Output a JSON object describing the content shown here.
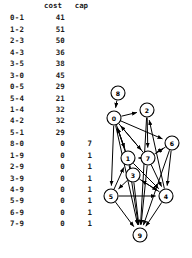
{
  "figure": {
    "kind": "edge-cost-capacity-table-with-directed-graph",
    "background_color": "#ffffff",
    "ink_color": "#000000"
  },
  "table": {
    "name": "edge-cost-cap-table",
    "columns": [
      "",
      "cost",
      "cap"
    ],
    "headers": {
      "pair": "",
      "cost": "cost",
      "cap": "cap"
    },
    "rows": [
      {
        "pair": "0-1",
        "cost": "41",
        "cap": ""
      },
      {
        "pair": "1-2",
        "cost": "51",
        "cap": ""
      },
      {
        "pair": "2-3",
        "cost": "50",
        "cap": ""
      },
      {
        "pair": "4-3",
        "cost": "36",
        "cap": ""
      },
      {
        "pair": "3-5",
        "cost": "38",
        "cap": ""
      },
      {
        "pair": "3-0",
        "cost": "45",
        "cap": ""
      },
      {
        "pair": "0-5",
        "cost": "29",
        "cap": ""
      },
      {
        "pair": "5-4",
        "cost": "21",
        "cap": ""
      },
      {
        "pair": "1-4",
        "cost": "32",
        "cap": ""
      },
      {
        "pair": "4-2",
        "cost": "32",
        "cap": ""
      },
      {
        "pair": "5-1",
        "cost": "29",
        "cap": ""
      },
      {
        "pair": "8-0",
        "cost": "0",
        "cap": "7"
      },
      {
        "pair": "1-9",
        "cost": "0",
        "cap": "1"
      },
      {
        "pair": "2-9",
        "cost": "0",
        "cap": "1"
      },
      {
        "pair": "3-9",
        "cost": "0",
        "cap": "1"
      },
      {
        "pair": "4-9",
        "cost": "0",
        "cap": "1"
      },
      {
        "pair": "5-9",
        "cost": "0",
        "cap": "1"
      },
      {
        "pair": "6-9",
        "cost": "0",
        "cap": "1"
      },
      {
        "pair": "7-9",
        "cost": "0",
        "cap": "1"
      }
    ]
  },
  "chart_data": {
    "type": "diagram",
    "subtype": "directed-graph",
    "title": "",
    "nodes": [
      {
        "id": "8",
        "label": "8",
        "x": 22,
        "y": 93
      },
      {
        "id": "0",
        "label": "0",
        "x": 18,
        "y": 118
      },
      {
        "id": "2",
        "label": "2",
        "x": 51,
        "y": 110
      },
      {
        "id": "6",
        "label": "6",
        "x": 76,
        "y": 143
      },
      {
        "id": "1",
        "label": "1",
        "x": 32,
        "y": 158
      },
      {
        "id": "7",
        "label": "7",
        "x": 52,
        "y": 158
      },
      {
        "id": "3",
        "label": "3",
        "x": 37,
        "y": 175
      },
      {
        "id": "5",
        "label": "5",
        "x": 15,
        "y": 196
      },
      {
        "id": "4",
        "label": "4",
        "x": 70,
        "y": 196
      },
      {
        "id": "9",
        "label": "9",
        "x": 44,
        "y": 235
      }
    ],
    "node_radius": 7,
    "edges": [
      {
        "from": "8",
        "to": "0"
      },
      {
        "from": "0",
        "to": "2"
      },
      {
        "from": "0",
        "to": "6"
      },
      {
        "from": "0",
        "to": "1"
      },
      {
        "from": "0",
        "to": "7"
      },
      {
        "from": "0",
        "to": "5"
      },
      {
        "from": "0",
        "to": "9"
      },
      {
        "from": "2",
        "to": "7"
      },
      {
        "from": "7",
        "to": "0"
      },
      {
        "from": "7",
        "to": "1"
      },
      {
        "from": "7",
        "to": "6"
      },
      {
        "from": "7",
        "to": "4"
      },
      {
        "from": "7",
        "to": "9"
      },
      {
        "from": "6",
        "to": "7"
      },
      {
        "from": "6",
        "to": "4"
      },
      {
        "from": "6",
        "to": "9"
      },
      {
        "from": "1",
        "to": "0"
      },
      {
        "from": "1",
        "to": "4"
      },
      {
        "from": "1",
        "to": "9"
      },
      {
        "from": "3",
        "to": "0"
      },
      {
        "from": "3",
        "to": "5"
      },
      {
        "from": "3",
        "to": "4"
      },
      {
        "from": "3",
        "to": "9"
      },
      {
        "from": "5",
        "to": "1"
      },
      {
        "from": "5",
        "to": "4"
      },
      {
        "from": "5",
        "to": "9"
      },
      {
        "from": "4",
        "to": "2"
      },
      {
        "from": "4",
        "to": "3"
      },
      {
        "from": "4",
        "to": "9"
      },
      {
        "from": "2",
        "to": "9"
      }
    ]
  }
}
